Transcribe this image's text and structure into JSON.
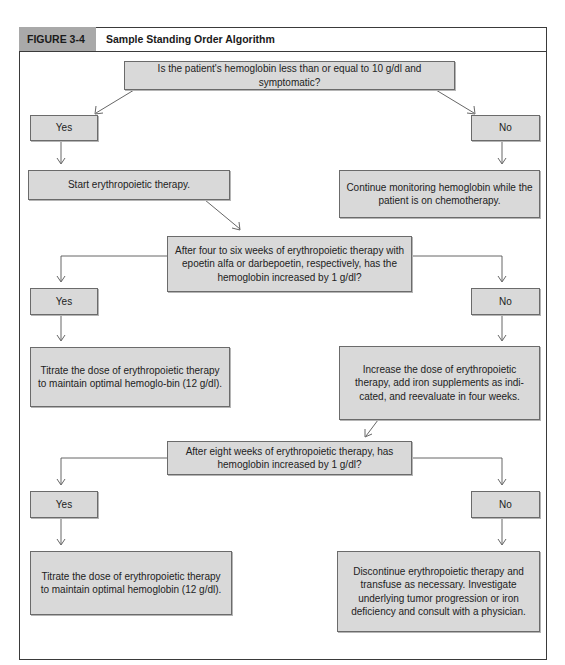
{
  "figure": {
    "label": "FIGURE 3-4",
    "title": "Sample Standing Order Algorithm"
  },
  "nodes": {
    "q1": "Is the patient's hemoglobin less than or equal to 10 g/dl and symptomatic?",
    "q1_yes": "Yes",
    "q1_no": "No",
    "start_therapy": "Start erythropoietic therapy.",
    "continue_monitoring": "Continue monitoring hemoglobin while the patient is on chemotherapy.",
    "q2": "After four to six weeks of erythropoietic therapy with epoetin alfa or darbepoetin, respectively, has the hemoglobin increased by 1 g/dl?",
    "q2_yes": "Yes",
    "q2_no": "No",
    "titrate_1": "Titrate the dose of erythropoietic therapy to maintain optimal hemoglo-bin (12 g/dl).",
    "increase_dose": "Increase the dose of erythropoietic therapy, add iron supplements as indi-cated, and reevaluate in four weeks.",
    "q3": "After eight weeks of erythropoietic therapy, has hemoglobin increased by 1 g/dl?",
    "q3_yes": "Yes",
    "q3_no": "No",
    "titrate_2": "Titrate the dose of erythropoietic therapy to maintain optimal hemoglobin (12 g/dl).",
    "discontinue": "Discontinue erythropoietic therapy and transfuse as necessary. Investigate underlying tumor progression or iron deficiency and consult with a physician."
  },
  "colors": {
    "box_fill": "#d9d9d9",
    "box_border": "#6b6b6b",
    "header_label_fill": "#a9a9a9",
    "frame": "#3a3a3a",
    "connector": "#555555"
  }
}
